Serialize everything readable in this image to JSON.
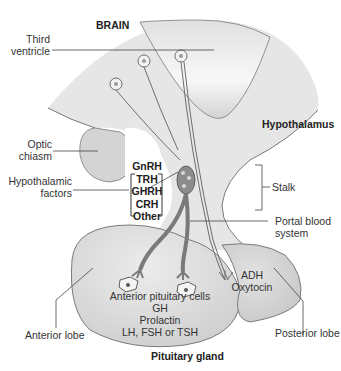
{
  "diagram": {
    "title": "Pituitary gland",
    "region_label": "BRAIN",
    "labels": {
      "third_ventricle": [
        "Third",
        "ventricle"
      ],
      "hypothalamus": "Hypothalamus",
      "optic_chiasm": [
        "Optic",
        "chiasm"
      ],
      "hypothalamic_factors": [
        "Hypothalamic",
        "factors"
      ],
      "factor_list": [
        "GnRH",
        "TRH",
        "GHRH",
        "CRH",
        "Other"
      ],
      "stalk": "Stalk",
      "portal_blood_system": [
        "Portal blood",
        "system"
      ],
      "posterior_hormones": [
        "ADH",
        "Oxytocin"
      ],
      "anterior_cells": [
        "Anterior pituitary cells",
        "GH",
        "Prolactin",
        "LH, FSH or TSH"
      ],
      "anterior_lobe": "Anterior lobe",
      "posterior_lobe": "Posterior lobe",
      "pituitary_gland": "Pituitary gland"
    },
    "colors": {
      "tissue_fill": "#e4e4e4",
      "lobe_fill": "#d6d6d6",
      "ventricle_fill": "#f4f4f4",
      "outline": "#7a7a7a",
      "vessel": "#6e6e6e",
      "text": "#333333"
    }
  }
}
